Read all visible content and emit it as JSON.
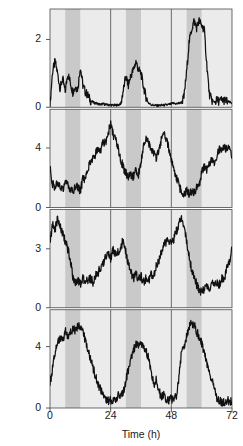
{
  "figure": {
    "axis_labels": {
      "y": "Firing rate (action potentials/sec)",
      "x": "Time (h)"
    },
    "x_ticks": [
      "0",
      "24",
      "48",
      "72"
    ],
    "colors": {
      "trace": "#111111",
      "light_band": "#ebebeb",
      "dark_band": "#c9c9c9",
      "axis": "#4a4a4a",
      "background": "#f7f7f7",
      "text": "#1a1a1a"
    }
  },
  "chart_data": {
    "type": "line",
    "title": "",
    "subtitle": "",
    "xlabel": "Time (h)",
    "ylabel": "Firing rate (action potentials/sec)",
    "xlim": [
      0,
      72
    ],
    "grid": false,
    "legend": null,
    "annotations": [
      "Shaded vertical bands indicate subjective night (dark phase); unshaded/light bands indicate subjective day.",
      "Vertical reference lines drawn at t = 24 h and t = 48 h."
    ],
    "shading": {
      "light_band_color": "#ebebeb",
      "dark_band_color": "#c9c9c9",
      "dark_bands_hours": [
        [
          6,
          12
        ],
        [
          30,
          36
        ],
        [
          54,
          60
        ]
      ],
      "light_bands_hours": [
        [
          0,
          6
        ],
        [
          12,
          24
        ],
        [
          24,
          30
        ],
        [
          36,
          48
        ],
        [
          48,
          54
        ],
        [
          60,
          72
        ]
      ],
      "reference_lines_hours": [
        24,
        48
      ]
    },
    "panels": [
      {
        "name": "panel-1",
        "ylim": [
          0,
          2.9
        ],
        "y_ticks": [
          0,
          2
        ],
        "y_tick_labels": [
          "0",
          "2"
        ],
        "x": [
          0,
          1,
          2,
          3,
          4,
          5,
          6,
          7,
          8,
          9,
          10,
          11,
          12,
          13,
          14,
          15,
          16,
          17,
          18,
          19,
          20,
          21,
          22,
          23,
          24,
          25,
          26,
          27,
          28,
          29,
          30,
          31,
          32,
          33,
          34,
          35,
          36,
          37,
          38,
          39,
          40,
          41,
          42,
          43,
          44,
          45,
          46,
          47,
          48,
          49,
          50,
          51,
          52,
          53,
          54,
          55,
          56,
          57,
          58,
          59,
          60,
          61,
          62,
          63,
          64,
          65,
          66,
          67,
          68,
          69,
          70,
          71,
          72
        ],
        "y": [
          0.05,
          1.05,
          1.35,
          1.0,
          0.55,
          0.85,
          0.45,
          1.0,
          0.75,
          0.45,
          0.6,
          0.55,
          1.2,
          0.65,
          0.45,
          0.35,
          0.2,
          0.15,
          0.12,
          0.1,
          0.08,
          0.1,
          0.08,
          0.07,
          0.07,
          0.06,
          0.06,
          0.07,
          0.1,
          0.5,
          0.9,
          0.65,
          0.95,
          1.1,
          1.35,
          1.1,
          1.0,
          0.6,
          0.3,
          0.12,
          0.08,
          0.06,
          0.05,
          0.05,
          0.06,
          0.06,
          0.07,
          0.08,
          0.1,
          0.12,
          0.1,
          0.12,
          0.14,
          0.3,
          1.0,
          1.9,
          2.3,
          2.55,
          2.35,
          2.55,
          2.4,
          2.3,
          1.3,
          0.4,
          0.2,
          0.15,
          0.2,
          0.18,
          0.22,
          0.2,
          0.18,
          0.15,
          0.12
        ]
      },
      {
        "name": "panel-2",
        "ylim": [
          0,
          6.6
        ],
        "y_ticks": [
          0,
          4
        ],
        "y_tick_labels": [
          "0",
          "4"
        ],
        "x": [
          0,
          1,
          2,
          3,
          4,
          5,
          6,
          7,
          8,
          9,
          10,
          11,
          12,
          13,
          14,
          15,
          16,
          17,
          18,
          19,
          20,
          21,
          22,
          23,
          24,
          25,
          26,
          27,
          28,
          29,
          30,
          31,
          32,
          33,
          34,
          35,
          36,
          37,
          38,
          39,
          40,
          41,
          42,
          43,
          44,
          45,
          46,
          47,
          48,
          49,
          50,
          51,
          52,
          53,
          54,
          55,
          56,
          57,
          58,
          59,
          60,
          61,
          62,
          63,
          64,
          65,
          66,
          67,
          68,
          69,
          70,
          71,
          72
        ],
        "y": [
          2.6,
          1.6,
          1.4,
          1.7,
          1.5,
          1.2,
          1.6,
          1.5,
          1.2,
          1.0,
          1.5,
          1.3,
          1.1,
          1.9,
          2.0,
          2.7,
          3.0,
          3.4,
          3.6,
          4.0,
          3.8,
          4.5,
          4.3,
          5.0,
          5.6,
          4.9,
          4.5,
          3.9,
          3.2,
          2.7,
          2.3,
          2.0,
          2.2,
          2.1,
          2.5,
          2.2,
          3.0,
          4.2,
          4.6,
          4.4,
          4.0,
          3.6,
          3.3,
          3.9,
          4.5,
          5.0,
          4.6,
          4.0,
          3.2,
          2.6,
          2.0,
          1.5,
          1.0,
          0.9,
          1.2,
          0.8,
          1.1,
          0.9,
          1.4,
          1.3,
          2.5,
          2.7,
          2.6,
          3.0,
          3.3,
          3.1,
          3.5,
          3.9,
          3.7,
          4.1,
          3.9,
          4.2,
          3.3
        ]
      },
      {
        "name": "panel-3",
        "ylim": [
          0,
          5.0
        ],
        "y_ticks": [
          0,
          3
        ],
        "y_tick_labels": [
          "0",
          "3"
        ],
        "x": [
          0,
          1,
          2,
          3,
          4,
          5,
          6,
          7,
          8,
          9,
          10,
          11,
          12,
          13,
          14,
          15,
          16,
          17,
          18,
          19,
          20,
          21,
          22,
          23,
          24,
          25,
          26,
          27,
          28,
          29,
          30,
          31,
          32,
          33,
          34,
          35,
          36,
          37,
          38,
          39,
          40,
          41,
          42,
          43,
          44,
          45,
          46,
          47,
          48,
          49,
          50,
          51,
          52,
          53,
          54,
          55,
          56,
          57,
          58,
          59,
          60,
          61,
          62,
          63,
          64,
          65,
          66,
          67,
          68,
          69,
          70,
          71,
          72
        ],
        "y": [
          3.2,
          4.3,
          4.0,
          4.5,
          4.2,
          3.8,
          3.4,
          3.0,
          2.5,
          1.6,
          1.2,
          1.4,
          1.2,
          1.5,
          1.3,
          1.4,
          1.5,
          1.3,
          1.6,
          1.8,
          2.0,
          2.2,
          2.6,
          2.8,
          2.5,
          3.0,
          2.7,
          2.8,
          3.0,
          3.6,
          2.8,
          2.2,
          1.8,
          1.5,
          1.7,
          1.4,
          1.6,
          1.3,
          1.5,
          1.4,
          1.7,
          1.6,
          2.1,
          2.4,
          2.8,
          3.2,
          3.3,
          3.4,
          3.2,
          3.5,
          3.9,
          4.3,
          4.6,
          4.2,
          3.4,
          2.6,
          2.0,
          1.5,
          1.2,
          0.9,
          0.8,
          1.0,
          1.2,
          1.0,
          1.3,
          1.1,
          1.3,
          1.2,
          1.5,
          1.4,
          2.0,
          2.3,
          3.0
        ]
      },
      {
        "name": "panel-4",
        "ylim": [
          0,
          6.4
        ],
        "y_ticks": [
          0,
          4
        ],
        "y_tick_labels": [
          "0",
          "4"
        ],
        "x": [
          0,
          1,
          2,
          3,
          4,
          5,
          6,
          7,
          8,
          9,
          10,
          11,
          12,
          13,
          14,
          15,
          16,
          17,
          18,
          19,
          20,
          21,
          22,
          23,
          24,
          25,
          26,
          27,
          28,
          29,
          30,
          31,
          32,
          33,
          34,
          35,
          36,
          37,
          38,
          39,
          40,
          41,
          42,
          43,
          44,
          45,
          46,
          47,
          48,
          49,
          50,
          51,
          52,
          53,
          54,
          55,
          56,
          57,
          58,
          59,
          60,
          61,
          62,
          63,
          64,
          65,
          66,
          67,
          68,
          69,
          70,
          71,
          72
        ],
        "y": [
          1.5,
          2.6,
          3.6,
          4.2,
          4.6,
          4.4,
          5.0,
          4.7,
          4.9,
          5.2,
          5.0,
          5.4,
          5.3,
          5.0,
          4.4,
          3.8,
          3.2,
          2.6,
          2.1,
          1.6,
          1.2,
          0.8,
          0.6,
          0.5,
          0.5,
          0.6,
          0.5,
          0.8,
          0.7,
          1.0,
          1.8,
          2.5,
          3.2,
          3.8,
          4.2,
          4.0,
          4.1,
          3.9,
          3.7,
          3.2,
          2.5,
          1.5,
          1.8,
          1.2,
          0.7,
          0.9,
          0.6,
          0.5,
          0.6,
          0.5,
          0.8,
          2.0,
          3.6,
          4.0,
          4.6,
          5.2,
          5.6,
          5.4,
          5.0,
          4.6,
          4.2,
          3.6,
          3.0,
          2.4,
          1.8,
          1.2,
          0.7,
          0.5,
          0.4,
          0.4,
          0.5,
          0.4,
          0.4
        ]
      }
    ]
  }
}
